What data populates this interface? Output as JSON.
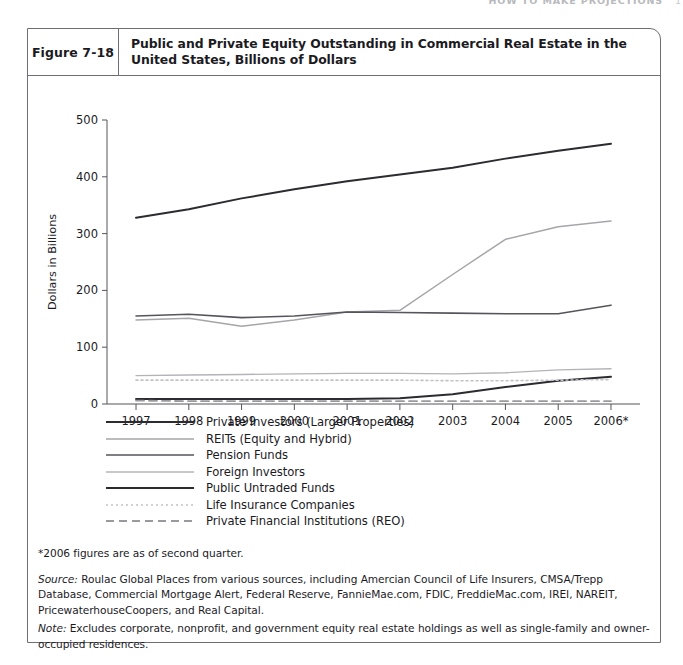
{
  "running_header": {
    "title": "HOW TO MAKE PROJECTIONS",
    "page": "1"
  },
  "figure": {
    "number": "Figure 7-18",
    "title": "Public and Private Equity Outstanding in Commercial Real Estate in the United States, Billions of Dollars"
  },
  "notes": {
    "asterisk": "*2006 figures are as of second quarter.",
    "source_label": "Source:",
    "source_text": " Roulac Global Places from various sources, including Amercian Council of Life Insurers, CMSA/Trepp Database, Commercial Mortgage Alert, Federal Reserve, FannieMae.com, FDIC, FreddieMac.com, IREI, NAREIT, PricewaterhouseCoopers, and Real Capital.",
    "note_label": "Note:",
    "note_text": " Excludes corporate, nonprofit, and government equity real estate holdings as well as single-family and owner-occupied residences."
  },
  "chart_data": {
    "type": "line",
    "title": "Public and Private Equity Outstanding in Commercial Real Estate in the United States, Billions of Dollars",
    "xlabel": "",
    "ylabel": "Dollars in Billions",
    "categories": [
      "1997",
      "1998",
      "1999",
      "2000",
      "2001",
      "2002",
      "2003",
      "2004",
      "2005",
      "2006*"
    ],
    "ylim": [
      0,
      500
    ],
    "yticks": [
      0,
      100,
      200,
      300,
      400,
      500
    ],
    "grid": false,
    "legend_position": "below",
    "series": [
      {
        "name": "Private Investors (Larger Properties)",
        "values": [
          328,
          343,
          362,
          378,
          392,
          404,
          416,
          432,
          446,
          458
        ],
        "color": "#2b2b30",
        "width": 2.0,
        "dash": ""
      },
      {
        "name": "REITs (Equity and Hybrid)",
        "values": [
          148,
          151,
          137,
          148,
          162,
          165,
          228,
          290,
          312,
          322
        ],
        "color": "#a6a6aa",
        "width": 1.5,
        "dash": ""
      },
      {
        "name": "Pension Funds",
        "values": [
          155,
          158,
          152,
          155,
          162,
          161,
          160,
          159,
          159,
          174
        ],
        "color": "#55555b",
        "width": 1.6,
        "dash": ""
      },
      {
        "name": "Foreign Investors",
        "values": [
          50,
          51,
          52,
          53,
          54,
          54,
          53,
          55,
          60,
          62
        ],
        "color": "#b4b4b8",
        "width": 1.4,
        "dash": ""
      },
      {
        "name": "Public Untraded Funds",
        "values": [
          9,
          9,
          9,
          9,
          9,
          10,
          17,
          30,
          41,
          48
        ],
        "color": "#2b2b30",
        "width": 2.0,
        "dash": ""
      },
      {
        "name": "Life Insurance Companies",
        "values": [
          42,
          42,
          42,
          42,
          42,
          42,
          41,
          41,
          42,
          43
        ],
        "color": "#c3c3c7",
        "width": 1.6,
        "dash": "2,3"
      },
      {
        "name": "Private Financial Institutions (REO)",
        "values": [
          6,
          5,
          5,
          5,
          5,
          5,
          5,
          5,
          5,
          5
        ],
        "color": "#9a9a9e",
        "width": 1.8,
        "dash": "8,5"
      }
    ]
  }
}
